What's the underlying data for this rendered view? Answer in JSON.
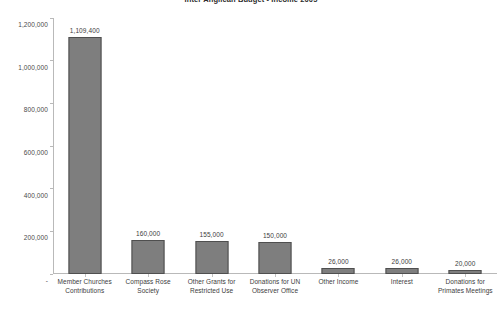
{
  "chart_data": {
    "type": "bar",
    "title": "Inter Anglican Budget - Income 2005",
    "xlabel": "",
    "ylabel": "",
    "ylim": [
      0,
      1200000
    ],
    "grid": false,
    "legend": false,
    "categories": [
      "Member Churches Contributions",
      "Compass Rose Society",
      "Other Grants for Restricted Use",
      "Donations for UN Observer Office",
      "Other Income",
      "Interest",
      "Donations for Primates Meetings"
    ],
    "values": [
      1109400,
      160000,
      155000,
      150000,
      26000,
      26000,
      20000
    ],
    "value_labels": [
      "1,109,400",
      "160,000",
      "155,000",
      "150,000",
      "26,000",
      "26,000",
      "20,000"
    ],
    "category_lines": [
      [
        "Member Churches",
        "Contributions"
      ],
      [
        "Compass Rose",
        "Society"
      ],
      [
        "Other Grants for",
        "Restricted Use"
      ],
      [
        "Donations for UN",
        "Observer Office"
      ],
      [
        "Other Income"
      ],
      [
        "Interest"
      ],
      [
        "Donations for",
        "Primates Meetings"
      ]
    ],
    "y_ticks": [
      0,
      200000,
      400000,
      600000,
      800000,
      1000000,
      1200000
    ],
    "y_tick_labels": [
      "-",
      "200,000",
      "400,000",
      "600,000",
      "800,000",
      "1,000,000",
      "1,200,000"
    ],
    "colors": {
      "bar_fill": "#7e7e7e",
      "bar_border": "#4f4f4f",
      "axis": "#b9b9b9",
      "text": "#3d3d3d",
      "background": "#ffffff"
    }
  }
}
